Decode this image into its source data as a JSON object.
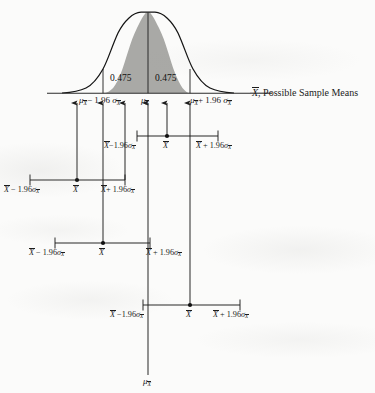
{
  "figure": {
    "type": "statistical-diagram",
    "axis_label": ", Possible Sample Means",
    "axis_label_symbol": "X",
    "shaded_area_left": "0.475",
    "shaded_area_right": "0.475",
    "colors": {
      "curve_fill": "#a9a9a6",
      "curve_stroke": "#141414",
      "line": "#1c1c1c",
      "paper": "#fbfbfa"
    }
  },
  "curve_axis_ticks": [
    {
      "id": "tick-lower",
      "symbol": "mu",
      "text": " − 1.96 ",
      "sigma": true,
      "x": 103
    },
    {
      "id": "tick-center",
      "symbol": "mu",
      "text": "",
      "sigma": false,
      "x": 148
    },
    {
      "id": "tick-upper",
      "symbol": "mu",
      "text": " + 1.96 ",
      "sigma": true,
      "x": 190
    }
  ],
  "axis_tick_labels": {
    "lower": "− 1.96",
    "center": "",
    "upper": "+ 1.96"
  },
  "interval_rows": [
    {
      "id": "interval-1",
      "lower_label": "−1.96",
      "mean_label": "",
      "upper_label": "+ 1.96",
      "left_x": 137,
      "mean_x": 167,
      "right_x": 218,
      "y": 136
    },
    {
      "id": "interval-2",
      "lower_label": "− 1.96",
      "mean_label": "",
      "upper_label": "+ 1.96",
      "left_x": 30,
      "mean_x": 77,
      "right_x": 125,
      "y": 180
    },
    {
      "id": "interval-3",
      "lower_label": "− 1.96",
      "mean_label": "",
      "upper_label": "+ 1.96",
      "left_x": 55,
      "mean_x": 103,
      "right_x": 150,
      "y": 243
    },
    {
      "id": "interval-4",
      "lower_label": "−1.96",
      "mean_label": "",
      "upper_label": "+ 1.96",
      "left_x": 143,
      "mean_x": 190,
      "right_x": 240,
      "y": 305
    }
  ],
  "bottom_label": {
    "symbol": "mu",
    "x": 167,
    "y": 378
  },
  "glyphs": {
    "mu": "μ",
    "sigma": "σ",
    "xbar_base": "X",
    "minus": "−",
    "plus": "+",
    "coefficient": "1.96"
  }
}
